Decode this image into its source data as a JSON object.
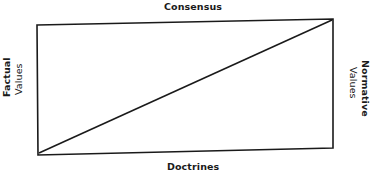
{
  "diagram": {
    "type": "quadrilateral-with-diagonal",
    "labels": {
      "top": "Consensus",
      "bottom": "Doctrines",
      "left": {
        "line1": "Factual",
        "line2": "Values"
      },
      "right": {
        "line1": "Normative",
        "line2": "Values"
      }
    },
    "shape": {
      "corners": {
        "top_left": [
          37,
          25
        ],
        "top_right": [
          333,
          19
        ],
        "bottom_right": [
          333,
          148
        ],
        "bottom_left": [
          38,
          155
        ]
      },
      "diagonal": {
        "from": "bottom_left",
        "to": "top_right"
      },
      "stroke_color": "#1a1a1a"
    }
  }
}
